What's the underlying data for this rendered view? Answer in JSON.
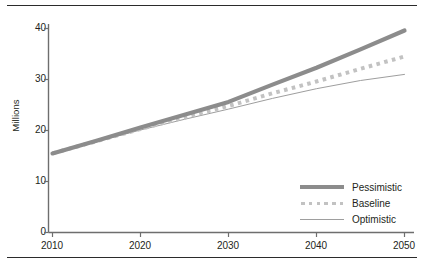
{
  "chart_data": {
    "type": "line",
    "title": "",
    "xlabel": "",
    "ylabel": "Millions",
    "xlim": [
      2010,
      2050
    ],
    "ylim": [
      0,
      40
    ],
    "xticks": [
      "2010",
      "2020",
      "2030",
      "2040",
      "2050"
    ],
    "yticks": [
      "0",
      "10",
      "20",
      "30",
      "40"
    ],
    "grid": false,
    "legend_position": "lower right",
    "x": [
      2010,
      2015,
      2020,
      2025,
      2030,
      2035,
      2040,
      2045,
      2050
    ],
    "series": [
      {
        "name": "Pessimistic",
        "style": "thick-solid",
        "color": "#8c8c8c",
        "values": [
          15.5,
          18.0,
          20.6,
          23.1,
          25.6,
          29.0,
          32.3,
          35.9,
          39.6
        ]
      },
      {
        "name": "Baseline",
        "style": "dotted",
        "color": "#c2c2c2",
        "values": [
          15.5,
          17.9,
          20.3,
          22.6,
          24.8,
          27.3,
          29.6,
          32.1,
          34.5
        ]
      },
      {
        "name": "Optimistic",
        "style": "thin-solid",
        "color": "#9e9e9e",
        "values": [
          15.5,
          17.8,
          20.1,
          22.2,
          24.2,
          26.3,
          28.2,
          29.8,
          31.0
        ]
      }
    ]
  },
  "legend": {
    "items": [
      {
        "label": "Pessimistic"
      },
      {
        "label": "Baseline"
      },
      {
        "label": "Optimistic"
      }
    ]
  },
  "axes": {
    "y_axis_title": "Millions",
    "y_tick_labels": [
      "40",
      "30",
      "20",
      "10",
      "0"
    ],
    "x_tick_labels": [
      "2010",
      "2020",
      "2030",
      "2040",
      "2050"
    ]
  },
  "colors": {
    "pessimistic": "#8c8c8c",
    "baseline": "#c2c2c2",
    "optimistic": "#9e9e9e",
    "axis": "#6e6e6e",
    "rule": "#2b2b2b",
    "text": "#231f20"
  }
}
